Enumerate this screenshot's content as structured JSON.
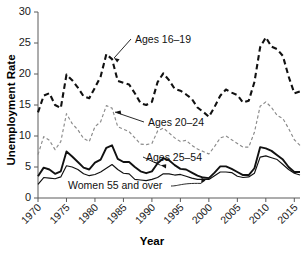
{
  "chart_data": {
    "type": "line",
    "title": "",
    "xlabel": "Year",
    "ylabel": "Unemployment Rate",
    "xlim": [
      1970,
      2016
    ],
    "ylim": [
      0,
      30
    ],
    "grid": false,
    "legend_position": "inline-annotations",
    "xticks": [
      "1970",
      "1975",
      "1980",
      "1985",
      "1990",
      "1995",
      "2000",
      "2005",
      "2010",
      "2015"
    ],
    "xtick_values": [
      1970,
      1975,
      1980,
      1985,
      1990,
      1995,
      2000,
      2005,
      2010,
      2015
    ],
    "yticks": [
      "0",
      "5",
      "10",
      "15",
      "20",
      "25",
      "30"
    ],
    "ytick_values": [
      0,
      5,
      10,
      15,
      20,
      25,
      30
    ],
    "x": [
      1970,
      1971,
      1972,
      1973,
      1974,
      1975,
      1976,
      1977,
      1978,
      1979,
      1980,
      1981,
      1982,
      1983,
      1984,
      1985,
      1986,
      1987,
      1988,
      1989,
      1990,
      1991,
      1992,
      1993,
      1994,
      1995,
      1996,
      1997,
      1998,
      1999,
      2000,
      2001,
      2002,
      2003,
      2004,
      2005,
      2006,
      2007,
      2008,
      2009,
      2010,
      2011,
      2012,
      2013,
      2014,
      2015,
      2016
    ],
    "series": [
      {
        "name": "Ages 16-19",
        "label": "Ages 16–19",
        "style": "heavy-dashed",
        "color": "#111111",
        "values": [
          13.8,
          16.5,
          16.9,
          15.0,
          14.5,
          19.9,
          19.0,
          17.8,
          16.4,
          16.1,
          17.8,
          19.6,
          23.2,
          22.4,
          18.9,
          18.6,
          18.3,
          16.9,
          15.3,
          15.0,
          15.5,
          18.7,
          20.1,
          19.0,
          17.6,
          17.3,
          16.7,
          16.0,
          14.6,
          13.9,
          13.1,
          14.7,
          16.5,
          17.5,
          17.0,
          16.6,
          15.4,
          15.7,
          18.7,
          24.3,
          25.9,
          24.4,
          24.0,
          22.9,
          19.6,
          16.9,
          17.2
        ]
      },
      {
        "name": "Ages 20-24",
        "label": "Ages 20–24",
        "style": "light-dashed",
        "color": "#8a8a8a",
        "values": [
          7.0,
          9.9,
          9.3,
          7.8,
          9.1,
          13.6,
          12.0,
          11.0,
          9.6,
          9.1,
          11.5,
          12.3,
          14.9,
          14.5,
          11.5,
          11.1,
          10.7,
          9.7,
          8.7,
          8.6,
          8.8,
          10.8,
          11.3,
          10.5,
          9.7,
          9.1,
          9.3,
          8.5,
          7.9,
          7.5,
          7.1,
          8.3,
          9.7,
          10.0,
          9.4,
          8.8,
          8.2,
          8.2,
          10.6,
          14.8,
          15.5,
          14.6,
          13.3,
          12.8,
          11.2,
          9.4,
          8.5
        ]
      },
      {
        "name": "Ages 25-54",
        "label": "Ages 25–54",
        "style": "heavy-solid",
        "color": "#111111",
        "values": [
          3.5,
          4.9,
          4.6,
          3.9,
          4.3,
          7.5,
          6.7,
          5.8,
          4.9,
          4.6,
          5.7,
          6.2,
          8.1,
          8.5,
          6.3,
          5.8,
          5.8,
          5.0,
          4.3,
          4.0,
          4.3,
          5.6,
          6.4,
          6.1,
          5.3,
          4.7,
          4.6,
          4.1,
          3.6,
          3.3,
          3.2,
          4.1,
          5.1,
          5.1,
          4.7,
          4.2,
          3.7,
          3.7,
          4.8,
          8.2,
          8.0,
          7.6,
          6.9,
          6.2,
          5.0,
          4.2,
          4.2
        ]
      },
      {
        "name": "Women 55 and over",
        "label": "Women 55 and over",
        "style": "thin-solid",
        "color": "#111111",
        "values": [
          2.2,
          3.3,
          3.2,
          3.1,
          3.4,
          5.2,
          5.0,
          4.6,
          3.9,
          3.6,
          3.8,
          4.2,
          4.8,
          5.4,
          4.6,
          4.0,
          3.9,
          3.0,
          2.9,
          2.8,
          3.0,
          3.3,
          3.9,
          3.9,
          3.7,
          3.8,
          3.5,
          3.2,
          3.0,
          3.0,
          3.0,
          3.6,
          4.2,
          4.2,
          4.1,
          3.5,
          3.3,
          3.4,
          4.0,
          6.6,
          6.8,
          6.5,
          6.2,
          5.4,
          4.6,
          4.0,
          3.7
        ]
      }
    ],
    "annotations": [
      {
        "name": "ages-16-19-annotation",
        "text": "Ages 16–19"
      },
      {
        "name": "ages-20-24-annotation",
        "text": "Ages 20–24"
      },
      {
        "name": "ages-25-54-annotation",
        "text": "Ages 25–54"
      },
      {
        "name": "women-55-annotation",
        "text": "Women 55 and over"
      }
    ]
  }
}
